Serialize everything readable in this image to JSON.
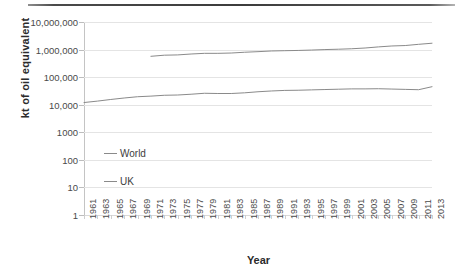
{
  "figure": {
    "top_rule": "horizontal-rule",
    "background_color": "#ffffff",
    "line_color": "#8a8a8a",
    "grid_color": "#e4e4e4"
  },
  "chart_data": {
    "type": "line",
    "title": "",
    "xlabel": "Year",
    "ylabel": "kt of oil equivalent",
    "yscale": "log",
    "ylim": [
      1,
      10000000
    ],
    "ytick_labels": [
      "10,000,000",
      "1,000,000",
      "100,000",
      "10,000",
      "1000",
      "100",
      "10",
      "1"
    ],
    "ytick_values": [
      10000000,
      1000000,
      100000,
      10000,
      1000,
      100,
      10,
      1
    ],
    "xlim": [
      1961,
      2013
    ],
    "xtick_labels": [
      "1961",
      "1963",
      "1965",
      "1967",
      "1969",
      "1971",
      "1973",
      "1975",
      "1977",
      "1979",
      "1981",
      "1983",
      "1985",
      "1987",
      "1989",
      "1991",
      "1993",
      "1995",
      "1997",
      "1999",
      "2001",
      "2003",
      "2005",
      "2007",
      "2009",
      "2011",
      "2013"
    ],
    "grid": true,
    "grid_axis": "y",
    "legend_position": "inside-lower-left",
    "series": [
      {
        "name": "World",
        "color": "#8a8a8a",
        "x": [
          1971,
          1973,
          1975,
          1977,
          1979,
          1981,
          1983,
          1985,
          1987,
          1989,
          1991,
          1993,
          1995,
          1997,
          1999,
          2001,
          2003,
          2005,
          2007,
          2009,
          2011,
          2013
        ],
        "values": [
          570000,
          625000,
          640000,
          690000,
          730000,
          730000,
          750000,
          800000,
          840000,
          890000,
          910000,
          930000,
          960000,
          1000000,
          1030000,
          1070000,
          1140000,
          1250000,
          1350000,
          1400000,
          1550000,
          1700000
        ]
      },
      {
        "name": "UK",
        "color": "#8a8a8a",
        "x": [
          1961,
          1963,
          1965,
          1967,
          1969,
          1971,
          1973,
          1975,
          1977,
          1979,
          1981,
          1983,
          1985,
          1987,
          1989,
          1991,
          1993,
          1995,
          1997,
          1999,
          2001,
          2003,
          2005,
          2007,
          2009,
          2011,
          2013
        ],
        "values": [
          12000,
          13500,
          15500,
          17500,
          19500,
          20500,
          22000,
          22500,
          24000,
          26000,
          25500,
          25500,
          27000,
          29500,
          31500,
          33000,
          33500,
          34500,
          35500,
          36500,
          37500,
          37500,
          38000,
          37000,
          36000,
          35000,
          45000
        ]
      }
    ]
  },
  "legend": {
    "items": [
      {
        "label": "World"
      },
      {
        "label": "UK"
      }
    ]
  }
}
